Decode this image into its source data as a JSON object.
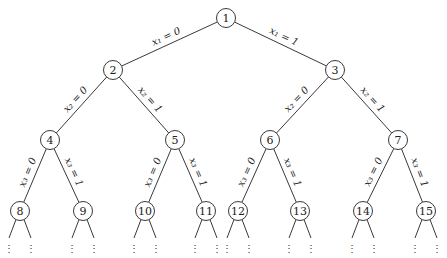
{
  "colors": {
    "line": "#222222",
    "background": "#ffffff"
  },
  "node_radius": 9.5,
  "nodes": [
    {
      "id": "1",
      "label": "1",
      "x": 226,
      "y": 18
    },
    {
      "id": "2",
      "label": "2",
      "x": 113,
      "y": 70
    },
    {
      "id": "3",
      "label": "3",
      "x": 335,
      "y": 70
    },
    {
      "id": "4",
      "label": "4",
      "x": 50,
      "y": 140
    },
    {
      "id": "5",
      "label": "5",
      "x": 175,
      "y": 140
    },
    {
      "id": "6",
      "label": "6",
      "x": 270,
      "y": 140
    },
    {
      "id": "7",
      "label": "7",
      "x": 398,
      "y": 140
    },
    {
      "id": "8",
      "label": "8",
      "x": 20,
      "y": 211
    },
    {
      "id": "9",
      "label": "9",
      "x": 83,
      "y": 211
    },
    {
      "id": "10",
      "label": "10",
      "x": 145,
      "y": 211
    },
    {
      "id": "11",
      "label": "11",
      "x": 206,
      "y": 211
    },
    {
      "id": "12",
      "label": "12",
      "x": 238,
      "y": 211
    },
    {
      "id": "13",
      "label": "13",
      "x": 300,
      "y": 211
    },
    {
      "id": "14",
      "label": "14",
      "x": 363,
      "y": 211
    },
    {
      "id": "15",
      "label": "15",
      "x": 426,
      "y": 211
    }
  ],
  "edges": [
    {
      "from": "1",
      "to": "2",
      "label": "x₁ = 0"
    },
    {
      "from": "1",
      "to": "3",
      "label": "x₁ = 1"
    },
    {
      "from": "2",
      "to": "4",
      "label": "x₂ = 0"
    },
    {
      "from": "2",
      "to": "5",
      "label": "x₂ = 1"
    },
    {
      "from": "3",
      "to": "6",
      "label": "x₂ = 0"
    },
    {
      "from": "3",
      "to": "7",
      "label": "x₂ = 1"
    },
    {
      "from": "4",
      "to": "8",
      "label": "x₃ = 0"
    },
    {
      "from": "4",
      "to": "9",
      "label": "x₃ = 1"
    },
    {
      "from": "5",
      "to": "10",
      "label": "x₃ = 0"
    },
    {
      "from": "5",
      "to": "11",
      "label": "x₃ = 1"
    },
    {
      "from": "6",
      "to": "12",
      "label": "x₃ = 0"
    },
    {
      "from": "6",
      "to": "13",
      "label": "x₃ = 1"
    },
    {
      "from": "7",
      "to": "14",
      "label": "x₃ = 0"
    },
    {
      "from": "7",
      "to": "15",
      "label": "x₃ = 1"
    }
  ],
  "continuation": {
    "symbol": "⋮",
    "leaf_ids": [
      "8",
      "9",
      "10",
      "11",
      "12",
      "13",
      "14",
      "15"
    ]
  }
}
